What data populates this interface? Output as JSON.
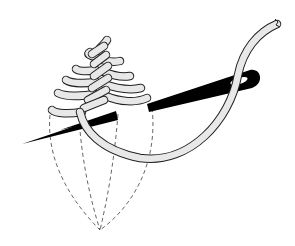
{
  "illustration": {
    "subject": "fern stitch embroidery diagram with needle and thread",
    "elements": {
      "stitches": "stitch-rows",
      "needle": "needle",
      "thread": "thread",
      "guide_lines": "dashed-guide-lines"
    }
  },
  "colors": {
    "background": "#ffffff",
    "needle": "#000000",
    "thread_fill": "#e6e6e6",
    "outline": "#222222",
    "guide": "#555555"
  },
  "geometry": {
    "convergence_point": [
      100,
      230
    ],
    "needle_tip": [
      22,
      144
    ],
    "needle_eye": [
      250,
      80
    ],
    "thread_end": [
      277,
      22
    ]
  }
}
